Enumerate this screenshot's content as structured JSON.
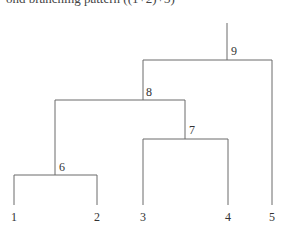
{
  "caption": "ond branching pattern ((1+2)+3)",
  "tree": {
    "internal_nodes": [
      {
        "label": "6",
        "children": [
          "1",
          "2"
        ]
      },
      {
        "label": "7",
        "children": [
          "3",
          "4"
        ]
      },
      {
        "label": "8",
        "children": [
          "6",
          "7"
        ]
      },
      {
        "label": "9",
        "children": [
          "8",
          "5"
        ]
      }
    ],
    "leaves": [
      "1",
      "2",
      "3",
      "4",
      "5"
    ],
    "labels": {
      "n1": "1",
      "n2": "2",
      "n3": "3",
      "n4": "4",
      "n5": "5",
      "n6": "6",
      "n7": "7",
      "n8": "8",
      "n9": "9"
    }
  }
}
